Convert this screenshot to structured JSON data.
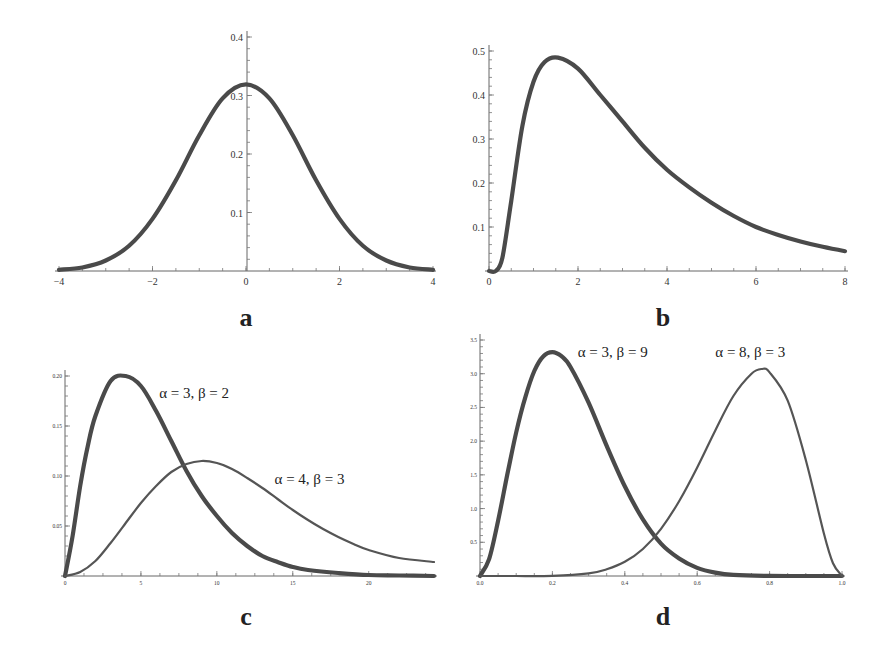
{
  "chart_data": [
    {
      "id": "a",
      "type": "line",
      "panel_label": "a",
      "title": "",
      "xlabel": "",
      "ylabel": "",
      "xlim": [
        -4,
        4
      ],
      "ylim": [
        0,
        0.4
      ],
      "x_ticks": [
        -4,
        -2,
        0,
        2,
        4
      ],
      "x_tick_labels": [
        "−4",
        "−2",
        "0",
        "2",
        "4"
      ],
      "y_ticks": [
        0.1,
        0.2,
        0.3,
        0.4
      ],
      "y_tick_labels": [
        "0.1",
        "0.2",
        "0.3",
        "0.4"
      ],
      "y_axis_at_x": 0,
      "grid": false,
      "legend": null,
      "series": [
        {
          "name": "density",
          "style": "thick",
          "x": [
            -4,
            -3.5,
            -3,
            -2.5,
            -2,
            -1.5,
            -1,
            -0.5,
            0,
            0.5,
            1,
            1.5,
            2,
            2.5,
            3,
            3.5,
            4
          ],
          "y": [
            0.002,
            0.006,
            0.018,
            0.043,
            0.089,
            0.155,
            0.232,
            0.295,
            0.319,
            0.295,
            0.232,
            0.155,
            0.089,
            0.043,
            0.018,
            0.006,
            0.002
          ]
        }
      ]
    },
    {
      "id": "b",
      "type": "line",
      "panel_label": "b",
      "title": "",
      "xlabel": "",
      "ylabel": "",
      "xlim": [
        0,
        8
      ],
      "ylim": [
        0,
        0.5
      ],
      "x_ticks": [
        0,
        2,
        4,
        6,
        8
      ],
      "x_tick_labels": [
        "0",
        "2",
        "4",
        "6",
        "8"
      ],
      "y_ticks": [
        0.1,
        0.2,
        0.3,
        0.4,
        0.5
      ],
      "y_tick_labels": [
        "0.1",
        "0.2",
        "0.3",
        "0.4",
        "0.5"
      ],
      "y_axis_at_x": 0,
      "grid": false,
      "legend": null,
      "series": [
        {
          "name": "density",
          "style": "thick",
          "x": [
            0,
            0.15,
            0.3,
            0.5,
            0.75,
            1.0,
            1.25,
            1.55,
            2.0,
            2.5,
            3.0,
            3.5,
            4.0,
            4.5,
            5.0,
            5.5,
            6.0,
            6.5,
            7.0,
            7.5,
            8.0
          ],
          "y": [
            0,
            0.0,
            0.03,
            0.16,
            0.33,
            0.43,
            0.475,
            0.485,
            0.46,
            0.4,
            0.34,
            0.28,
            0.23,
            0.19,
            0.155,
            0.125,
            0.1,
            0.082,
            0.067,
            0.055,
            0.045
          ]
        }
      ]
    },
    {
      "id": "c",
      "type": "line",
      "panel_label": "c",
      "title": "",
      "xlabel": "",
      "ylabel": "",
      "xlim": [
        0,
        24.3
      ],
      "ylim": [
        0,
        0.22
      ],
      "x_ticks": [
        0,
        5,
        10,
        15,
        20
      ],
      "x_tick_labels": [
        "0",
        "5",
        "10",
        "15",
        "20"
      ],
      "y_ticks": [
        0.05,
        0.1,
        0.15,
        0.2
      ],
      "y_tick_labels": [
        "0.05",
        "0.10",
        "0.15",
        "0.20"
      ],
      "y_axis_at_x": 0,
      "grid": false,
      "legend": null,
      "annotations": [
        {
          "text": "α = 3,  β = 2",
          "x": 6.2,
          "y": 0.178
        },
        {
          "text": "α = 4,  β = 3",
          "x": 13.8,
          "y": 0.092
        }
      ],
      "series": [
        {
          "name": "α = 3, β = 2",
          "style": "thick",
          "x": [
            0,
            0.5,
            1,
            1.5,
            2,
            3,
            4,
            5,
            6,
            7,
            8,
            9,
            10,
            11,
            12,
            13,
            14,
            15,
            16,
            18,
            20,
            22,
            24.3
          ],
          "y": [
            0,
            0.04,
            0.09,
            0.13,
            0.16,
            0.195,
            0.2,
            0.19,
            0.165,
            0.135,
            0.105,
            0.08,
            0.06,
            0.043,
            0.03,
            0.02,
            0.014,
            0.009,
            0.006,
            0.003,
            0.001,
            0.0005,
            0.0
          ]
        },
        {
          "name": "α = 4, β = 3",
          "style": "thin",
          "x": [
            0,
            1,
            2,
            3,
            4,
            5,
            6,
            7,
            8,
            9,
            10,
            11,
            12,
            13,
            14,
            15,
            16,
            17,
            18,
            19,
            20,
            22,
            24.3
          ],
          "y": [
            0,
            0.004,
            0.015,
            0.033,
            0.053,
            0.073,
            0.09,
            0.104,
            0.112,
            0.115,
            0.113,
            0.107,
            0.098,
            0.088,
            0.077,
            0.066,
            0.056,
            0.047,
            0.039,
            0.032,
            0.026,
            0.018,
            0.014
          ]
        }
      ]
    },
    {
      "id": "d",
      "type": "line",
      "panel_label": "d",
      "title": "",
      "xlabel": "",
      "ylabel": "",
      "xlim": [
        0,
        1
      ],
      "ylim": [
        0,
        3.5
      ],
      "x_ticks": [
        0,
        0.2,
        0.4,
        0.6,
        0.8,
        1.0
      ],
      "x_tick_labels": [
        "0.0",
        "0.2",
        "0.4",
        "0.6",
        "0.8",
        "1.0"
      ],
      "y_ticks": [
        0.5,
        1.0,
        1.5,
        2.0,
        2.5,
        3.0,
        3.5
      ],
      "y_tick_labels": [
        "0.5",
        "1.0",
        "1.5",
        "2.0",
        "2.5",
        "3.0",
        "3.5"
      ],
      "y_axis_at_x": 0,
      "grid": false,
      "legend": null,
      "annotations": [
        {
          "text": "α = 3,  β = 9",
          "x": 0.27,
          "y": 3.25
        },
        {
          "text": "α = 8,  β = 3",
          "x": 0.65,
          "y": 3.25
        }
      ],
      "series": [
        {
          "name": "α = 3, β = 9",
          "style": "thick",
          "x": [
            0,
            0.025,
            0.05,
            0.075,
            0.1,
            0.125,
            0.15,
            0.175,
            0.2,
            0.225,
            0.25,
            0.3,
            0.35,
            0.4,
            0.45,
            0.5,
            0.55,
            0.6,
            0.65,
            0.7,
            0.8,
            0.9,
            1.0
          ],
          "y": [
            0,
            0.25,
            0.82,
            1.49,
            2.13,
            2.65,
            3.04,
            3.26,
            3.32,
            3.26,
            3.1,
            2.57,
            1.93,
            1.33,
            0.84,
            0.48,
            0.26,
            0.12,
            0.05,
            0.016,
            0.001,
            0,
            0
          ]
        },
        {
          "name": "α = 8, β = 3",
          "style": "thin",
          "x": [
            0,
            0.1,
            0.2,
            0.3,
            0.35,
            0.4,
            0.45,
            0.5,
            0.55,
            0.6,
            0.65,
            0.7,
            0.75,
            0.778,
            0.8,
            0.85,
            0.9,
            0.95,
            0.975,
            1.0
          ],
          "y": [
            0,
            0,
            0.003,
            0.039,
            0.1,
            0.21,
            0.4,
            0.7,
            1.11,
            1.61,
            2.16,
            2.67,
            3.0,
            3.07,
            3.02,
            2.6,
            1.72,
            0.63,
            0.19,
            0
          ]
        }
      ]
    }
  ],
  "layout": {
    "panels": {
      "a": {
        "x0": 59,
        "x1": 433,
        "y0": 271,
        "yAxisPx": 247,
        "yScaleTop": 37
      },
      "b": {
        "x0": 489,
        "x1": 845,
        "y0": 271,
        "yAxisPx": 489,
        "yScaleTop": 51
      },
      "c": {
        "x0": 65,
        "x1": 434,
        "y0": 576,
        "yAxisPx": 65,
        "yScaleTop": 376
      },
      "d": {
        "x0": 480,
        "x1": 842,
        "y0": 576,
        "yAxisPx": 480,
        "yScaleTop": 340
      }
    }
  },
  "labels": {
    "a": "a",
    "b": "b",
    "c": "c",
    "d": "d"
  }
}
